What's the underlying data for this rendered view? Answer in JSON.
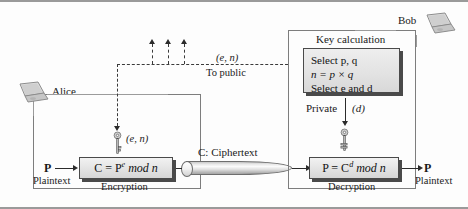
{
  "figure": {
    "accent_color": "#4a4a4a",
    "line_color": "#6b6b6b"
  },
  "alice": {
    "actor_label": "Alice",
    "laptop_icon": "laptop-icon",
    "plaintext_symbol": "P",
    "plaintext_label": "Plaintext",
    "process_formula_prefix": "C = P",
    "process_formula_exp": "e",
    "process_formula_suffix": " mod n",
    "process_caption": "Encryption",
    "key_icon": "key-icon",
    "key_label": "(e, n)"
  },
  "bob": {
    "actor_label": "Bob",
    "laptop_icon": "laptop-icon",
    "keycalc_title": "Key calculation",
    "keycalc_lines": [
      "Select p, q",
      "n = p × q",
      "Select e and d"
    ],
    "private_label": "Private",
    "private_key_value": "(d)",
    "key_icon": "key-icon",
    "process_formula_prefix": "P = C",
    "process_formula_exp": "d",
    "process_formula_suffix": " mod n",
    "process_caption": "Decryption",
    "plaintext_symbol": "P",
    "plaintext_label": "Plaintext"
  },
  "channel": {
    "label": "C: Ciphertext",
    "shape": "cylinder-pipe-icon"
  },
  "public_path": {
    "key_pair_label": "(e, n)",
    "destination_label": "To public",
    "arrow_count": 3,
    "style": "dashed"
  }
}
